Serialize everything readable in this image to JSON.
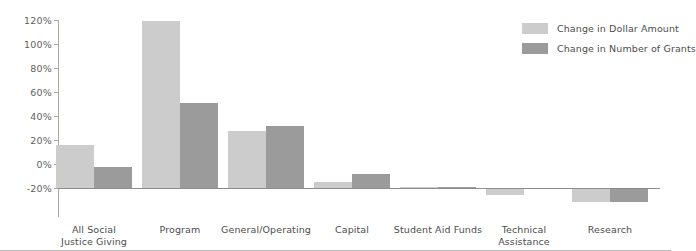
{
  "chart_data": {
    "type": "bar",
    "title": "",
    "subtitle": "",
    "xlabel": "",
    "ylabel": "",
    "ylim": [
      -20,
      120
    ],
    "ytick_step": 20,
    "grid": false,
    "legend_position": "top-right",
    "categories": [
      "All Social Justice Giving",
      "Program",
      "General/Operating",
      "Capital",
      "Student Aid Funds",
      "Technical Assistance",
      "Research"
    ],
    "category_lines": [
      [
        "All Social",
        "Justice Giving"
      ],
      [
        "Program"
      ],
      [
        "General/Operating"
      ],
      [
        "Capital"
      ],
      [
        "Student Aid Funds"
      ],
      [
        "Technical",
        "Assistance"
      ],
      [
        "Research"
      ]
    ],
    "ytick_labels": [
      "120%",
      "100%",
      "80%",
      "60%",
      "40%",
      "20%",
      "0%",
      "-20%"
    ],
    "ytick_values": [
      120,
      100,
      80,
      60,
      40,
      20,
      0,
      -20
    ],
    "series": [
      {
        "name": "Change in Dollar Amount",
        "color": "#cccccc",
        "values": [
          31,
          119,
          41,
          4,
          0.5,
          -5,
          -10
        ]
      },
      {
        "name": "Change in Number of Grants",
        "color": "#9b9b9b",
        "values": [
          15,
          61,
          44,
          10,
          0.5,
          -1,
          -10
        ]
      }
    ]
  },
  "legend": {
    "items": [
      {
        "label": "Change in Dollar Amount",
        "color": "#cccccc"
      },
      {
        "label": "Change in Number of Grants",
        "color": "#9b9b9b"
      }
    ]
  },
  "colors": {
    "series_light": "#cccccc",
    "series_dark": "#9b9b9b",
    "axis": "#a8a8a8",
    "baseline": "#8e8e8e",
    "text": "#4d4d4d",
    "background": "#ffffff"
  }
}
